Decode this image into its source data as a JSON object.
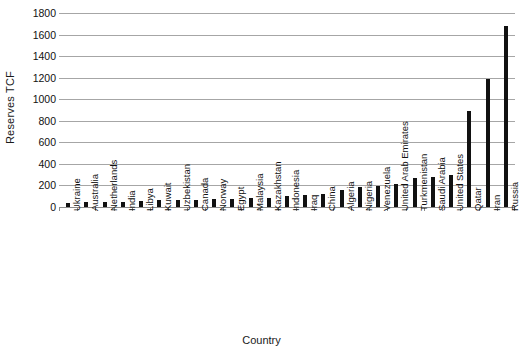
{
  "chart_data": {
    "type": "bar",
    "title": "",
    "xlabel": "Country",
    "ylabel": "Reserves TCF",
    "ylim": [
      0,
      1800
    ],
    "ytick_step": 200,
    "yticks": [
      1800,
      1600,
      1400,
      1200,
      1000,
      800,
      600,
      400,
      200,
      0
    ],
    "grid": true,
    "legend": "none",
    "bar_color": "#111111",
    "gridline_color": "#a6a6a6",
    "categories": [
      "Ukraine",
      "Australia",
      "Netherlands",
      "India",
      "Libya",
      "Kuwait",
      "Uzbekistan",
      "Canada",
      "Norway",
      "Egypt",
      "Malaysia",
      "Kazakhstan",
      "Indonesia",
      "Iraq",
      "China",
      "Algeria",
      "Nigeria",
      "Venezuela",
      "United Arab Emirates",
      "Turkmenistan",
      "Saudi Arabia",
      "United States",
      "Qatar",
      "Iran",
      "Russia"
    ],
    "values": [
      39,
      43,
      44,
      47,
      55,
      63,
      65,
      68,
      72,
      77,
      83,
      85,
      98,
      112,
      124,
      159,
      182,
      195,
      215,
      265,
      279,
      300,
      890,
      1190,
      1680
    ]
  }
}
